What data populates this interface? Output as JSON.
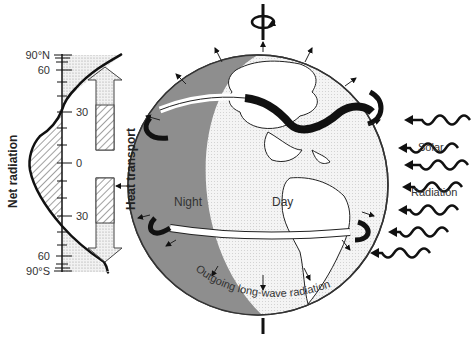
{
  "diagram": {
    "net_radiation_panel": {
      "axis_label": "Net radiation",
      "transport_label": "Heat transport",
      "latitude_ticks": [
        {
          "label": "90°N",
          "lat": 90
        },
        {
          "label": "60",
          "lat": 60
        },
        {
          "label": "30",
          "lat": 30
        },
        {
          "label": "0",
          "lat": 0
        },
        {
          "label": "30",
          "lat": -30
        },
        {
          "label": "60",
          "lat": -60
        },
        {
          "label": "90°S",
          "lat": -90
        }
      ],
      "surplus_region": "hatched (tropics, ~35°N to ~35°S)",
      "deficit_region": "stippled (poleward of ~35°)"
    },
    "globe": {
      "night_label": "Night",
      "day_label": "Day",
      "outgoing_label": "Outgoing long-wave radiation"
    },
    "solar": {
      "label_line1": "Solar",
      "label_line2": "Radiation",
      "arrow_count": 8
    },
    "colors": {
      "night": "#8e8e8e",
      "day_stipple": "#e6e6e6",
      "line": "#111111",
      "background": "#ffffff"
    }
  }
}
